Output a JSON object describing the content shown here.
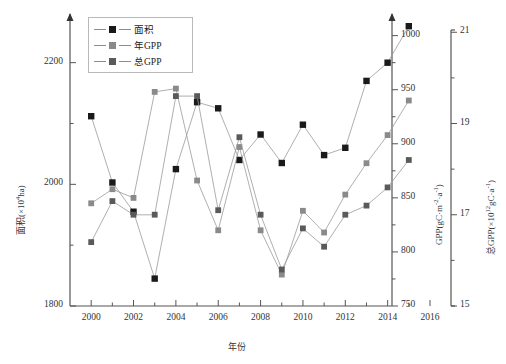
{
  "legend": {
    "position": "top-left-inside",
    "items": [
      {
        "label": "面积",
        "color": "#1a1a1a",
        "key": "area"
      },
      {
        "label": "年GPP",
        "color": "#8a8a8a",
        "key": "gpp_year"
      },
      {
        "label": "总GPP",
        "color": "#5a5a5a",
        "key": "gpp_total"
      }
    ]
  },
  "axes": {
    "x": {
      "label": "年份",
      "ticks": [
        "2000",
        "2002",
        "2004",
        "2006",
        "2008",
        "2010",
        "2012",
        "2014",
        "2016"
      ],
      "min": 1999,
      "max": 2016
    },
    "y_left": {
      "label_main": "面积(×10",
      "label_sup": "4",
      "label_tail": "ha)",
      "ticks": [
        "1800",
        "2000",
        "2200"
      ],
      "min": 1800,
      "max": 2280
    },
    "y_right1": {
      "label_main": "GPP(gC·m",
      "label_sup": "-2",
      "label_mid": "·a",
      "label_sup2": "-1",
      "label_tail": ")",
      "ticks": [
        "750",
        "800",
        "850",
        "900",
        "950",
        "1000"
      ],
      "min": 750,
      "max": 1020
    },
    "y_right2": {
      "label_main": "总GPP(×10",
      "label_sup": "12",
      "label_mid": "gC·a",
      "label_sup2": "-1",
      "label_tail": ")",
      "ticks": [
        "15",
        "17",
        "19",
        "21"
      ],
      "min": 15,
      "max": 21.4
    }
  },
  "chart_data": {
    "type": "line",
    "title": "",
    "xlabel": "年份",
    "ylabel": "面积(×10⁴ha)",
    "grid": false,
    "legend_position": "top-left",
    "x": [
      2000,
      2001,
      2002,
      2003,
      2004,
      2005,
      2006,
      2007,
      2008,
      2009,
      2010,
      2011,
      2012,
      2013,
      2014,
      2015
    ],
    "series": [
      {
        "name": "面积",
        "unit": "×10⁴ha",
        "axis": "y_left",
        "color": "#1a1a1a",
        "values": [
          2112,
          2003,
          1955,
          1845,
          2025,
          2135,
          2125,
          2040,
          2082,
          2035,
          2098,
          2048,
          2060,
          2170,
          2200,
          2260
        ]
      },
      {
        "name": "年GPP",
        "unit": "gC·m⁻²·a⁻¹",
        "axis": "y_right1",
        "color": "#8a8a8a",
        "values": [
          845,
          858,
          850,
          948,
          951,
          866,
          820,
          897,
          820,
          779,
          838,
          818,
          853,
          882,
          908,
          940
        ]
      },
      {
        "name": "总GPP",
        "unit": "×10¹²gC·a⁻¹",
        "axis": "y_right2",
        "color": "#5a5a5a",
        "values": [
          16.4,
          17.3,
          17.0,
          17.0,
          19.6,
          19.6,
          17.1,
          18.7,
          17.0,
          15.8,
          16.7,
          16.3,
          17.0,
          17.2,
          17.6,
          18.2
        ]
      }
    ],
    "annotations": []
  }
}
